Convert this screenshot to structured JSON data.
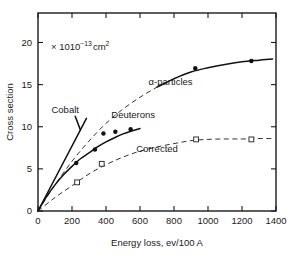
{
  "chart_data": {
    "type": "line",
    "title": "",
    "xlabel": "Energy loss, ev/100 A",
    "ylabel": "Cross section",
    "unit_annotation": "× 10",
    "unit_exponent": "−13",
    "unit_suffix": "cm",
    "unit_suffix_exponent": "2",
    "xlim": [
      0,
      1400
    ],
    "ylim": [
      0,
      23.5
    ],
    "xticks": [
      0,
      200,
      400,
      600,
      800,
      1000,
      1200,
      1400
    ],
    "xtick_labels": [
      "0",
      "200",
      "400",
      "600",
      "800",
      "1000",
      "1200",
      "1400"
    ],
    "yticks": [
      0,
      5,
      10,
      15,
      20
    ],
    "ytick_labels": [
      "0",
      "5",
      "10",
      "15",
      "20"
    ],
    "grid": false,
    "legend_position": "inline-annotations",
    "series": [
      {
        "name": "α-particles",
        "label": "α-particles",
        "marker": "filled-circle",
        "line_style": "dashed-then-solid",
        "label_x": 780,
        "label_y": 15.0,
        "points": [
          {
            "x": 925,
            "y": 16.95
          },
          {
            "x": 1255,
            "y": 17.8
          }
        ],
        "curve": [
          {
            "x": 0,
            "y": 0
          },
          {
            "x": 100,
            "y": 3.1
          },
          {
            "x": 200,
            "y": 5.9
          },
          {
            "x": 300,
            "y": 8.3
          },
          {
            "x": 400,
            "y": 10.4
          },
          {
            "x": 500,
            "y": 12.1
          },
          {
            "x": 600,
            "y": 13.5
          },
          {
            "x": 700,
            "y": 14.7
          },
          {
            "x": 800,
            "y": 15.7
          },
          {
            "x": 900,
            "y": 16.5
          },
          {
            "x": 1000,
            "y": 17.0
          },
          {
            "x": 1100,
            "y": 17.4
          },
          {
            "x": 1200,
            "y": 17.7
          },
          {
            "x": 1300,
            "y": 17.9
          },
          {
            "x": 1380,
            "y": 18.05
          }
        ],
        "solid_from_x": 760
      },
      {
        "name": "Deuterons",
        "label": "Deuterons",
        "marker": "filled-circle",
        "line_style": "solid",
        "label_x": 560,
        "label_y": 11.0,
        "points": [
          {
            "x": 225,
            "y": 5.7
          },
          {
            "x": 335,
            "y": 7.3
          },
          {
            "x": 385,
            "y": 9.2
          },
          {
            "x": 455,
            "y": 9.4
          },
          {
            "x": 545,
            "y": 9.7
          }
        ],
        "curve": [
          {
            "x": 0,
            "y": 0
          },
          {
            "x": 50,
            "y": 1.7
          },
          {
            "x": 100,
            "y": 3.1
          },
          {
            "x": 150,
            "y": 4.3
          },
          {
            "x": 200,
            "y": 5.3
          },
          {
            "x": 250,
            "y": 6.2
          },
          {
            "x": 300,
            "y": 6.9
          },
          {
            "x": 350,
            "y": 7.6
          },
          {
            "x": 400,
            "y": 8.2
          },
          {
            "x": 450,
            "y": 8.7
          },
          {
            "x": 500,
            "y": 9.15
          },
          {
            "x": 550,
            "y": 9.5
          },
          {
            "x": 600,
            "y": 9.8
          }
        ]
      },
      {
        "name": "Corrected",
        "label": "Corrected",
        "marker": "open-square",
        "line_style": "dashed",
        "label_x": 700,
        "label_y": 7.0,
        "points": [
          {
            "x": 230,
            "y": 3.4
          },
          {
            "x": 375,
            "y": 5.6
          },
          {
            "x": 930,
            "y": 8.5
          },
          {
            "x": 1255,
            "y": 8.5
          }
        ],
        "curve": [
          {
            "x": 0,
            "y": 0
          },
          {
            "x": 100,
            "y": 1.6
          },
          {
            "x": 200,
            "y": 3.0
          },
          {
            "x": 300,
            "y": 4.4
          },
          {
            "x": 400,
            "y": 5.5
          },
          {
            "x": 500,
            "y": 6.4
          },
          {
            "x": 600,
            "y": 7.1
          },
          {
            "x": 700,
            "y": 7.6
          },
          {
            "x": 800,
            "y": 8.0
          },
          {
            "x": 900,
            "y": 8.35
          },
          {
            "x": 1000,
            "y": 8.5
          },
          {
            "x": 1100,
            "y": 8.55
          },
          {
            "x": 1200,
            "y": 8.55
          },
          {
            "x": 1300,
            "y": 8.6
          },
          {
            "x": 1390,
            "y": 8.6
          }
        ]
      },
      {
        "name": "Cobalt",
        "label": "Cobalt",
        "marker": "none",
        "line_style": "solid",
        "label_x": 160,
        "label_y": 11.6,
        "points": [],
        "curve": [
          {
            "x": 0,
            "y": 0
          },
          {
            "x": 285,
            "y": 11.0
          }
        ]
      }
    ]
  },
  "colors": {
    "axis": "#1a1a1a",
    "curve_solid": "#111111",
    "curve_dashed": "#333333",
    "background": "#ffffff"
  }
}
